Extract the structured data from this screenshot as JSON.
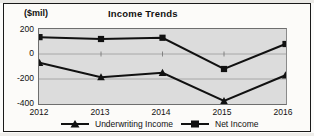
{
  "chart_data": {
    "type": "line",
    "title": "Income Trends",
    "xlabel": "",
    "ylabel": "($mil)",
    "unit_label": "($mil)",
    "categories": [
      "2012",
      "2013",
      "2014",
      "2015",
      "2016"
    ],
    "x": [
      2012,
      2013,
      2014,
      2015,
      2016
    ],
    "ylim": [
      -400,
      200
    ],
    "yticks": [
      200,
      0,
      -200,
      -400
    ],
    "ytick_labels": [
      "200",
      "0",
      "-200",
      "-400"
    ],
    "grid": true,
    "legend_position": "bottom",
    "plot_background": "#dcdcdc",
    "series_color": "#111111",
    "series": [
      {
        "name": "Underwriting Income",
        "marker": "triangle",
        "values": [
          -70,
          -185,
          -150,
          -375,
          -170
        ]
      },
      {
        "name": "Net Income",
        "marker": "square",
        "values": [
          135,
          120,
          130,
          -120,
          80
        ]
      }
    ]
  },
  "legend": {
    "items": [
      {
        "label": "Underwriting Income",
        "marker": "triangle-marker-icon"
      },
      {
        "label": "Net Income",
        "marker": "square-marker-icon"
      }
    ]
  }
}
